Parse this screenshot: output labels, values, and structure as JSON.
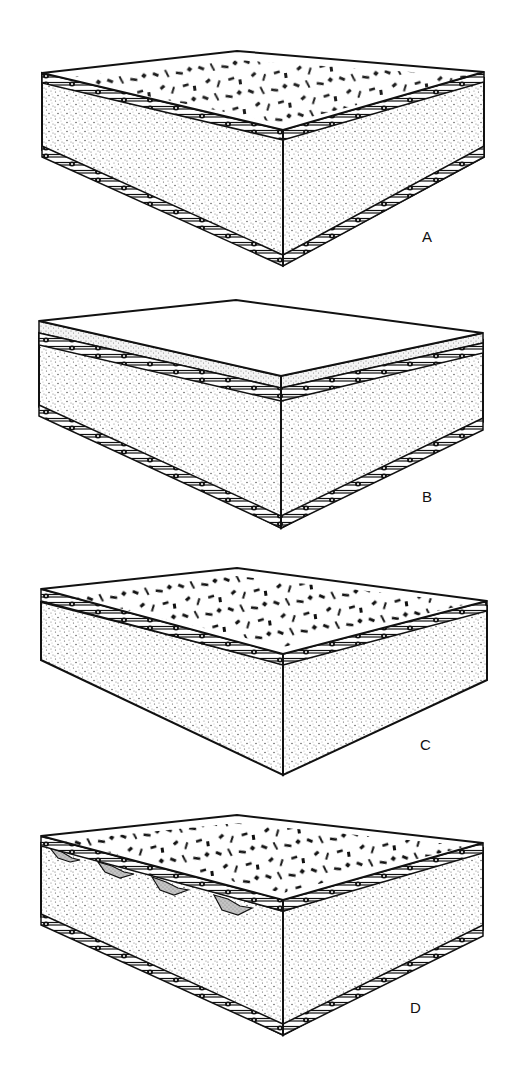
{
  "diagram": {
    "type": "layered panel cross-sections",
    "panels": [
      {
        "id": "A",
        "label": "A",
        "top_surface": "chips",
        "top_skin": true,
        "top_coating": false,
        "ribs": false,
        "bottom_skin": true
      },
      {
        "id": "B",
        "label": "B",
        "top_surface": "plain",
        "top_skin": true,
        "top_coating": true,
        "ribs": false,
        "bottom_skin": true
      },
      {
        "id": "C",
        "label": "C",
        "top_surface": "chips",
        "top_skin": true,
        "top_coating": false,
        "ribs": false,
        "bottom_skin": false
      },
      {
        "id": "D",
        "label": "D",
        "top_surface": "chips",
        "top_skin": true,
        "top_coating": false,
        "ribs": true,
        "bottom_skin": true
      }
    ]
  },
  "colors": {
    "line": "#111111",
    "stipple": "#555555",
    "rib_fill": "#bbbbbb",
    "background": "#ffffff"
  }
}
